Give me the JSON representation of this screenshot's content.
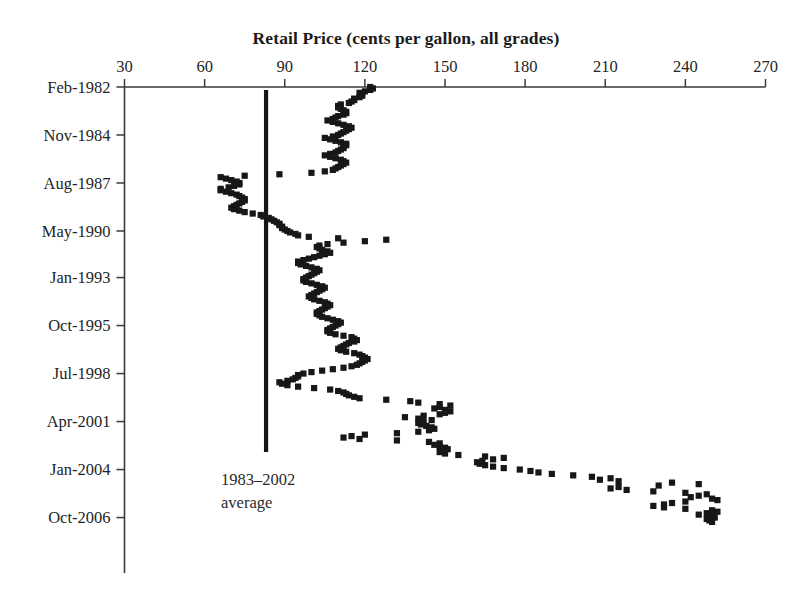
{
  "chart_data": {
    "type": "scatter",
    "title": "Retail Price (cents per gallon, all grades)",
    "xlabel": "Retail Price (cents per gallon, all grades)",
    "ylabel": "",
    "orientation": "horizontal-value-vertical-time",
    "xlim": [
      30,
      270
    ],
    "ylim_labels": [
      "Feb-1982",
      "Oct-2006"
    ],
    "grid": false,
    "legend": null,
    "x_ticks": [
      30,
      60,
      90,
      120,
      150,
      180,
      210,
      240,
      270
    ],
    "x_tick_labels": [
      "30",
      "60",
      "90",
      "120",
      "150",
      "180",
      "210",
      "240",
      "270"
    ],
    "y_ticks": [
      "Feb-1982",
      "Nov-1984",
      "Aug-1987",
      "May-1990",
      "Jan-1993",
      "Oct-1995",
      "Jul-1998",
      "Apr-2001",
      "Jan-2004",
      "Oct-2006"
    ],
    "y_tick_index": [
      0,
      33,
      66,
      99,
      131,
      164,
      197,
      230,
      263,
      296
    ],
    "annotations": [
      {
        "name": "average-reference-line",
        "lines": [
          "1983–2002",
          "average"
        ],
        "value": 83,
        "from_index": 2,
        "to_index": 251
      }
    ],
    "point_color": "#171717",
    "marker": "square",
    "series_name": "Monthly U.S. retail gasoline price",
    "x_start_index": 0,
    "index_unit": "months since Feb-1982",
    "values": [
      122,
      123,
      122,
      120,
      118,
      119,
      119,
      118,
      116,
      116,
      115,
      114,
      111,
      110,
      110,
      111,
      112,
      113,
      113,
      112,
      110,
      109,
      108,
      106,
      108,
      110,
      112,
      114,
      115,
      114,
      113,
      112,
      111,
      110,
      108,
      105,
      107,
      109,
      111,
      113,
      113,
      112,
      112,
      111,
      110,
      109,
      107,
      105,
      107,
      109,
      111,
      112,
      113,
      112,
      111,
      110,
      109,
      108,
      105,
      100,
      88,
      75,
      66,
      68,
      70,
      72,
      73,
      73,
      71,
      69,
      66,
      66,
      68,
      70,
      72,
      73,
      74,
      75,
      75,
      74,
      73,
      72,
      71,
      70,
      71,
      73,
      75,
      78,
      81,
      82,
      84,
      85,
      86,
      87,
      88,
      88,
      89,
      89,
      90,
      91,
      92,
      94,
      95,
      99,
      110,
      128,
      120,
      112,
      106,
      103,
      102,
      103,
      104,
      106,
      107,
      105,
      103,
      101,
      99,
      97,
      95,
      95,
      96,
      98,
      100,
      102,
      103,
      102,
      101,
      100,
      99,
      98,
      97,
      97,
      98,
      100,
      102,
      104,
      105,
      104,
      103,
      102,
      101,
      100,
      99,
      100,
      101,
      103,
      105,
      106,
      107,
      106,
      105,
      104,
      103,
      102,
      102,
      103,
      104,
      106,
      108,
      110,
      111,
      110,
      109,
      108,
      107,
      106,
      106,
      107,
      109,
      112,
      115,
      116,
      117,
      116,
      114,
      113,
      112,
      111,
      110,
      111,
      113,
      116,
      118,
      119,
      120,
      121,
      120,
      119,
      118,
      117,
      115,
      112,
      108,
      104,
      100,
      97,
      95,
      95,
      94,
      93,
      91,
      88,
      89,
      91,
      95,
      101,
      107,
      110,
      112,
      113,
      114,
      116,
      118,
      128,
      137,
      140,
      148,
      152,
      148,
      146,
      150,
      152,
      150,
      148,
      142,
      135,
      140,
      145,
      142,
      140,
      141,
      143,
      145,
      146,
      144,
      140,
      132,
      120,
      115,
      112,
      118,
      132,
      144,
      148,
      146,
      148,
      150,
      151,
      150,
      148,
      150,
      155,
      165,
      172,
      168,
      164,
      162,
      163,
      165,
      168,
      172,
      178,
      182,
      185,
      190,
      198,
      205,
      212,
      208,
      215,
      235,
      245,
      230,
      215,
      212,
      218,
      228,
      240,
      248,
      245,
      242,
      250,
      252,
      240,
      235,
      232,
      228,
      232,
      240,
      250,
      252,
      248,
      245,
      250,
      251,
      248,
      249,
      250
    ]
  },
  "axis": {
    "x_axis_name": "price-axis",
    "y_axis_name": "time-axis"
  }
}
